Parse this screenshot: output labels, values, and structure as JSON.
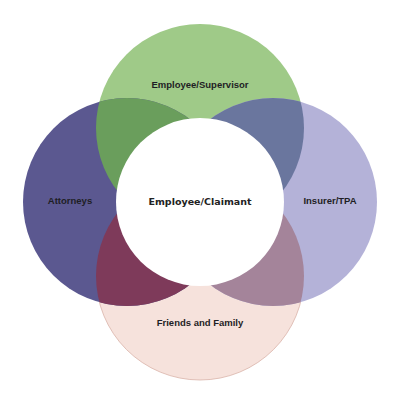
{
  "diagram": {
    "type": "venn",
    "center": {
      "label": "Employee/Claimant",
      "color": "#ffffff"
    },
    "circles": [
      {
        "label": "Employee/Supervisor",
        "position": "top",
        "color": "#9fca88"
      },
      {
        "label": "Attorneys",
        "position": "left",
        "color": "#5b5890"
      },
      {
        "label": "Insurer/TPA",
        "position": "right",
        "color": "#b4b2d8"
      },
      {
        "label": "Friends and Family",
        "position": "bottom",
        "color": "#f6e2dc"
      }
    ],
    "overlaps": [
      {
        "between": [
          "Employee/Supervisor",
          "Attorneys"
        ],
        "color": "#6a9e5c"
      },
      {
        "between": [
          "Employee/Supervisor",
          "Insurer/TPA"
        ],
        "color": "#6a769e"
      },
      {
        "between": [
          "Attorneys",
          "Friends and Family"
        ],
        "color": "#7e3a5a"
      },
      {
        "between": [
          "Insurer/TPA",
          "Friends and Family"
        ],
        "color": "#a4849a"
      }
    ]
  }
}
